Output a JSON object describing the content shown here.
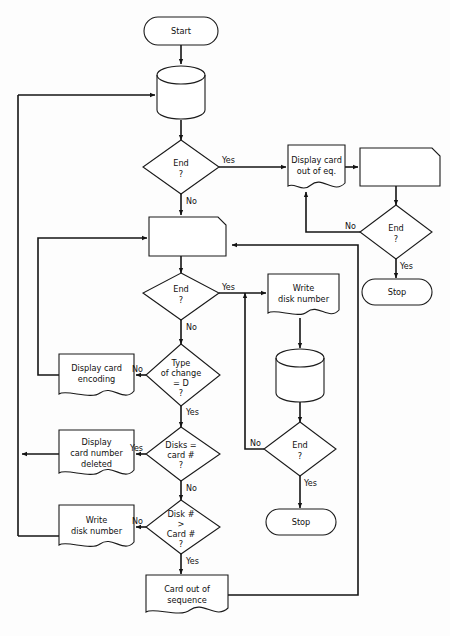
{
  "diagram": {
    "type": "flowchart",
    "canvas": {
      "width": 450,
      "height": 636
    },
    "colors": {
      "stroke": "#141414",
      "fill": "#ffffff",
      "background": "#fdfdfd"
    }
  },
  "nodes": {
    "start": {
      "label": "Start",
      "shape": "terminator"
    },
    "disk_read": {
      "label": "",
      "shape": "magnetic-disk"
    },
    "end_1": {
      "label_line1": "End",
      "label_line2": "?",
      "shape": "decision"
    },
    "display_card_out_of_eq": {
      "label_line1": "Display card",
      "label_line2": "out of eq.",
      "shape": "document"
    },
    "punch_card_1": {
      "label": "",
      "shape": "punched-card"
    },
    "end_2": {
      "label_line1": "End",
      "label_line2": "?",
      "shape": "decision"
    },
    "stop_1": {
      "label": "Stop",
      "shape": "terminator"
    },
    "punch_card_2": {
      "label": "",
      "shape": "punched-card"
    },
    "end_3": {
      "label_line1": "End",
      "label_line2": "?",
      "shape": "decision"
    },
    "write_disk_number_top": {
      "label_line1": "Write",
      "label_line2": "disk number",
      "shape": "document"
    },
    "disk_write": {
      "label": "",
      "shape": "magnetic-disk"
    },
    "end_4": {
      "label_line1": "End",
      "label_line2": "?",
      "shape": "decision"
    },
    "stop_2": {
      "label": "Stop",
      "shape": "terminator"
    },
    "display_card_encoding": {
      "label_line1": "Display card",
      "label_line2": "encoding",
      "shape": "document"
    },
    "type_of_change": {
      "label_line1": "Type",
      "label_line2": "of change",
      "label_line3": "= D",
      "label_line4": "?",
      "shape": "decision"
    },
    "display_card_number_deleted": {
      "label_line1": "Display",
      "label_line2": "card number",
      "label_line3": "deleted",
      "shape": "document"
    },
    "disks_eq_card": {
      "label_line1": "Disks =",
      "label_line2": "card #",
      "label_line3": "?",
      "shape": "decision"
    },
    "write_disk_number_bottom": {
      "label_line1": "Write",
      "label_line2": "disk number",
      "shape": "document"
    },
    "disk_gt_card": {
      "label_line1": "Disk #",
      "label_line2": ">",
      "label_line3": "Card #",
      "label_line4": "?",
      "shape": "decision"
    },
    "card_out_of_sequence": {
      "label_line1": "Card out of",
      "label_line2": "sequence",
      "shape": "document"
    }
  },
  "edge_labels": {
    "end1_yes": "Yes",
    "end1_no": "No",
    "end2_no": "No",
    "end2_yes": "Yes",
    "end3_yes": "Yes",
    "end3_no": "No",
    "end4_no": "No",
    "end4_yes": "Yes",
    "type_no": "No",
    "type_yes": "Yes",
    "disks_yes": "Yes",
    "disks_no": "No",
    "diskgt_no": "No",
    "diskgt_yes": "Yes"
  }
}
